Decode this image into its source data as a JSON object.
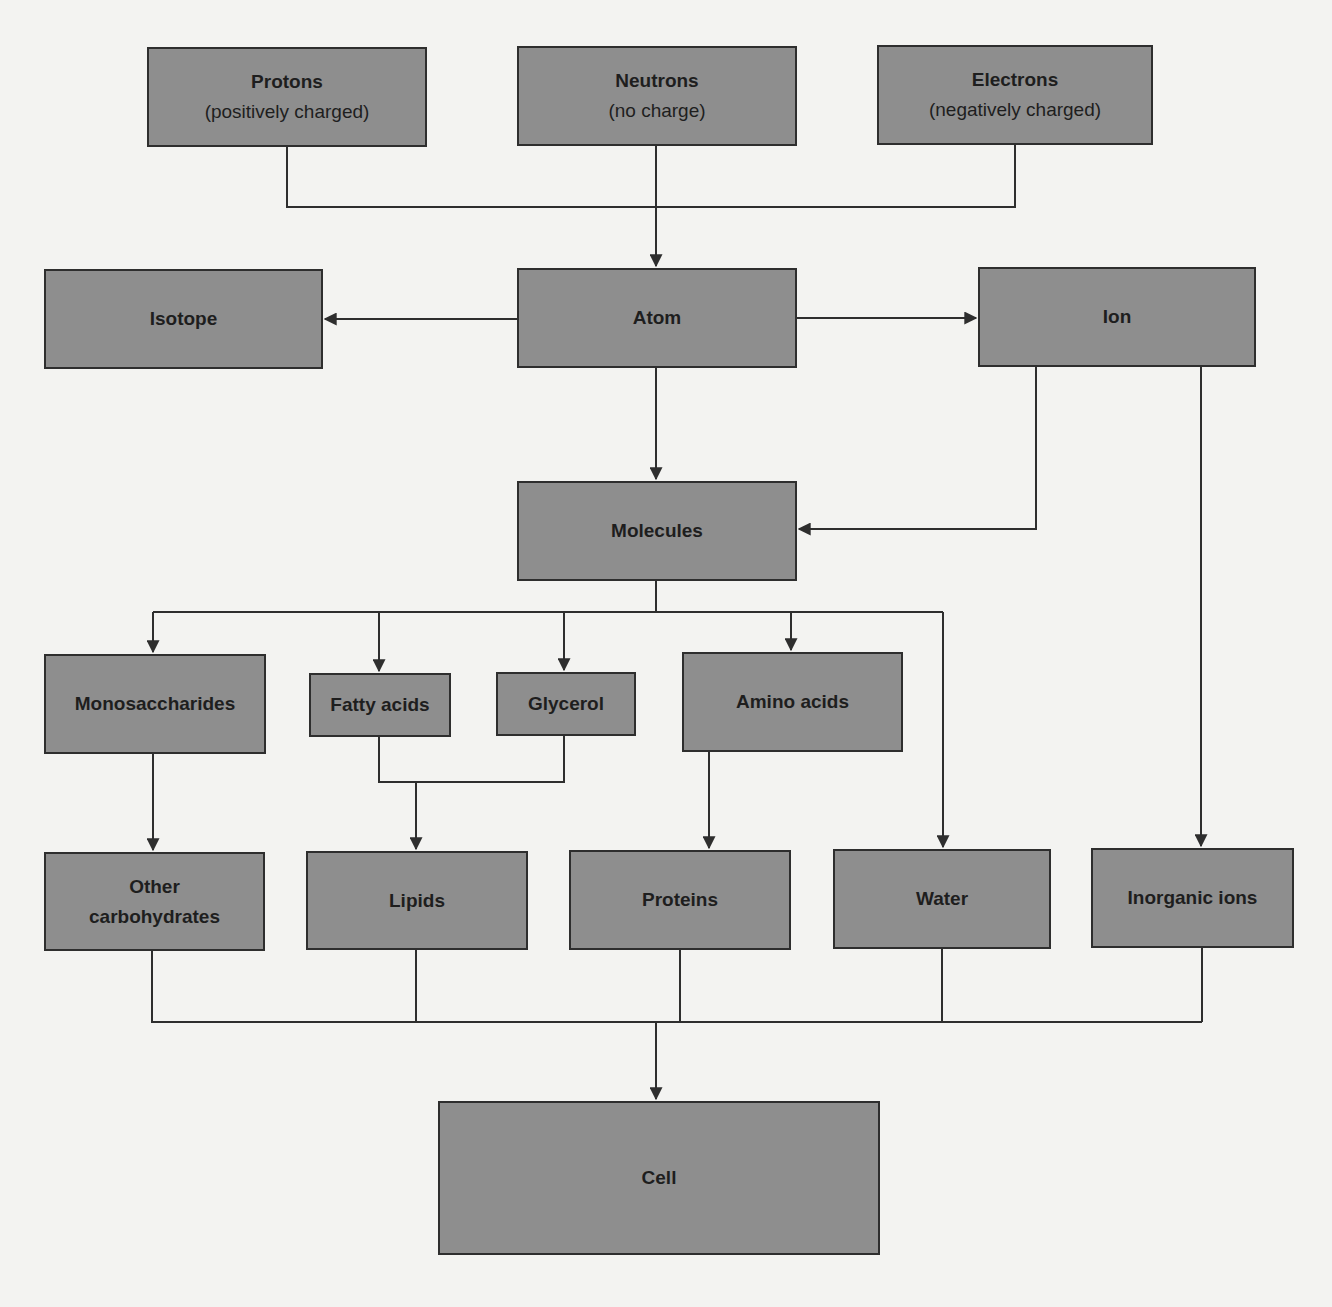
{
  "colors": {
    "background": "#f3f3f1",
    "node_fill": "#8e8e8e",
    "node_border": "#2e2e2e",
    "line": "#2e2e2e",
    "text": "#1e1e1e"
  },
  "nodes": {
    "protons": {
      "label": "Protons",
      "sub": "(positively charged)",
      "box": [
        147,
        47,
        280,
        100
      ]
    },
    "neutrons": {
      "label": "Neutrons",
      "sub": "(no charge)",
      "box": [
        517,
        46,
        280,
        100
      ]
    },
    "electrons": {
      "label": "Electrons",
      "sub": "(negatively charged)",
      "box": [
        877,
        45,
        276,
        100
      ]
    },
    "isotope": {
      "label": "Isotope",
      "box": [
        44,
        269,
        279,
        100
      ]
    },
    "atom": {
      "label": "Atom",
      "box": [
        517,
        268,
        280,
        100
      ]
    },
    "ion": {
      "label": "Ion",
      "box": [
        978,
        267,
        278,
        100
      ]
    },
    "molecules": {
      "label": "Molecules",
      "box": [
        517,
        481,
        280,
        100
      ]
    },
    "monosaccharides": {
      "label": "Monosaccharides",
      "box": [
        44,
        654,
        222,
        100
      ]
    },
    "fatty_acids": {
      "label": "Fatty acids",
      "box": [
        309,
        673,
        142,
        64
      ]
    },
    "glycerol": {
      "label": "Glycerol",
      "box": [
        496,
        672,
        140,
        64
      ]
    },
    "amino_acids": {
      "label": "Amino acids",
      "box": [
        682,
        652,
        221,
        100
      ]
    },
    "other_carbohydrates": {
      "label": "Other",
      "sub": "carbohydrates",
      "box": [
        44,
        852,
        221,
        99
      ]
    },
    "lipids": {
      "label": "Lipids",
      "box": [
        306,
        851,
        222,
        99
      ]
    },
    "proteins": {
      "label": "Proteins",
      "box": [
        569,
        850,
        222,
        100
      ]
    },
    "water": {
      "label": "Water",
      "box": [
        833,
        849,
        218,
        100
      ]
    },
    "inorganic_ions": {
      "label": "Inorganic ions",
      "box": [
        1091,
        848,
        203,
        100
      ]
    },
    "cell": {
      "label": "Cell",
      "box": [
        438,
        1101,
        442,
        154
      ]
    }
  },
  "edges": [
    {
      "from": "protons",
      "to": "atom",
      "path": "M287,147 V207 H656"
    },
    {
      "from": "electrons",
      "to": "atom",
      "path": "M1015,145 V207 H656"
    },
    {
      "from": "neutrons",
      "to": "atom",
      "path": "M656,146 V266",
      "arrow": true
    },
    {
      "from": "atom",
      "to": "isotope",
      "path": "M517,319 H325",
      "arrow": true
    },
    {
      "from": "atom",
      "to": "ion",
      "path": "M797,318 H976",
      "arrow": true
    },
    {
      "from": "atom",
      "to": "molecules",
      "path": "M656,368 V479",
      "arrow": true
    },
    {
      "from": "ion",
      "to": "molecules",
      "path": "M1036,367 V529 H799",
      "arrow": true
    },
    {
      "from": "ion",
      "to": "inorganic_ions",
      "path": "M1201,367 V846",
      "arrow": true
    },
    {
      "from": "molecules",
      "to": "bus",
      "path": "M656,581 V612"
    },
    {
      "from": "bus",
      "to": "monosaccharides",
      "path": "M153,612 H943 M153,612 V652",
      "arrow": true
    },
    {
      "from": "bus",
      "to": "fatty_acids",
      "path": "M379,612 V671",
      "arrow": true
    },
    {
      "from": "bus",
      "to": "glycerol",
      "path": "M564,612 V670",
      "arrow": true
    },
    {
      "from": "bus",
      "to": "amino_acids",
      "path": "M791,612 V650",
      "arrow": true
    },
    {
      "from": "bus",
      "to": "water",
      "path": "M943,612 V847",
      "arrow": true
    },
    {
      "from": "monosaccharides",
      "to": "other_carbohydrates",
      "path": "M153,754 V850",
      "arrow": true
    },
    {
      "from": "fatty_acids",
      "to": "lipids",
      "path": "M379,737 V782 H564 V736 M416,782 V849",
      "arrow": true
    },
    {
      "from": "amino_acids",
      "to": "proteins",
      "path": "M709,752 V848",
      "arrow": true
    },
    {
      "from": "other_carbohydrates",
      "to": "cell",
      "path": "M152,951 V1022 H1202 M416,950 V1022 M680,950 V1022 M942,949 V1022 M1202,948 V1022"
    },
    {
      "from": "bus2",
      "to": "cell",
      "path": "M656,1022 V1099",
      "arrow": true
    }
  ]
}
